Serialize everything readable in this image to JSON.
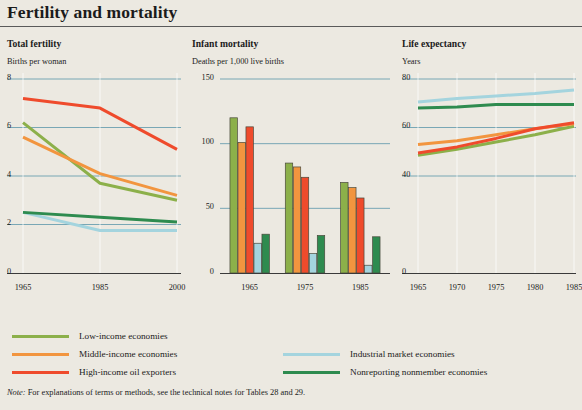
{
  "title": "Fertility and mortality",
  "note_prefix": "Note:",
  "note": " For explanations of terms or methods, see the technical notes for Tables 28 and 29.",
  "colors": {
    "background": "#ece9e1",
    "low_income": "#8cb04a",
    "middle_income": "#f2953f",
    "high_income_oil": "#ef4b2c",
    "industrial": "#a4d4de",
    "nonreporting": "#2e8b4f",
    "gridline": "#6c9fb0",
    "axis": "#3a3a3a",
    "title_rule": "#5a5a5a"
  },
  "legend": {
    "column1": [
      {
        "label": "Low-income economies",
        "color_key": "low_income"
      },
      {
        "label": "Middle-income economies",
        "color_key": "middle_income"
      },
      {
        "label": "High-income oil exporters",
        "color_key": "high_income_oil"
      }
    ],
    "column2": [
      {
        "label": "Industrial market economies",
        "color_key": "industrial"
      },
      {
        "label": "Nonreporting nonmember economies",
        "color_key": "nonreporting"
      }
    ]
  },
  "chart_data": [
    {
      "type": "line",
      "id": "total-fertility",
      "title": "Total fertility",
      "ylabel": "Births per woman",
      "xlabel": "",
      "x": [
        1965,
        1985,
        2000
      ],
      "tick_labels_x": [
        "1965",
        "1985",
        "2000"
      ],
      "ylim": [
        0,
        8
      ],
      "yticks": [
        0,
        2,
        4,
        6,
        8
      ],
      "ytick_labels": [
        "0",
        "2",
        "4",
        "6",
        "8"
      ],
      "grid": true,
      "series": [
        {
          "name": "Low-income economies",
          "color_key": "low_income",
          "values": [
            6.2,
            3.7,
            3.0
          ]
        },
        {
          "name": "Middle-income economies",
          "color_key": "middle_income",
          "values": [
            5.6,
            4.1,
            3.2
          ]
        },
        {
          "name": "High-income oil exporters",
          "color_key": "high_income_oil",
          "values": [
            7.2,
            6.8,
            5.1
          ]
        },
        {
          "name": "Industrial market economies",
          "color_key": "industrial",
          "values": [
            2.5,
            1.75,
            1.75
          ]
        },
        {
          "name": "Nonreporting nonmember economies",
          "color_key": "nonreporting",
          "values": [
            2.5,
            2.3,
            2.1
          ]
        }
      ]
    },
    {
      "type": "bar",
      "id": "infant-mortality",
      "title": "Infant mortality",
      "ylabel": "Deaths per 1,000 live births",
      "xlabel": "",
      "categories": [
        "1965",
        "1975",
        "1985"
      ],
      "ylim": [
        0,
        150
      ],
      "yticks": [
        0,
        50,
        100,
        150
      ],
      "ytick_labels": [
        "0",
        "50",
        "100",
        "150"
      ],
      "grid": true,
      "series": [
        {
          "name": "Low-income economies",
          "color_key": "low_income",
          "values": [
            120,
            85,
            70
          ]
        },
        {
          "name": "Middle-income economies",
          "color_key": "middle_income",
          "values": [
            101,
            82,
            66
          ]
        },
        {
          "name": "High-income oil exporters",
          "color_key": "high_income_oil",
          "values": [
            113,
            74,
            58
          ]
        },
        {
          "name": "Industrial market economies",
          "color_key": "industrial",
          "values": [
            23,
            15,
            6
          ]
        },
        {
          "name": "Nonreporting nonmember economies",
          "color_key": "nonreporting",
          "values": [
            30,
            29,
            28
          ]
        }
      ]
    },
    {
      "type": "line",
      "id": "life-expectancy",
      "title": "Life expectancy",
      "ylabel": "Years",
      "xlabel": "",
      "x": [
        1965,
        1970,
        1975,
        1980,
        1985
      ],
      "tick_labels_x": [
        "1965",
        "1970",
        "1975",
        "1980",
        "1985"
      ],
      "ylim": [
        0,
        80
      ],
      "yticks": [
        0,
        40,
        60,
        80
      ],
      "ytick_labels": [
        "0",
        "40",
        "60",
        "80"
      ],
      "grid": true,
      "series": [
        {
          "name": "Low-income economies",
          "color_key": "low_income",
          "values": [
            48.5,
            51.0,
            54.0,
            57.0,
            60.5
          ]
        },
        {
          "name": "Middle-income economies",
          "color_key": "middle_income",
          "values": [
            53.0,
            54.5,
            57.0,
            59.5,
            61.5
          ]
        },
        {
          "name": "High-income oil exporters",
          "color_key": "high_income_oil",
          "values": [
            49.5,
            52.0,
            55.5,
            59.5,
            62.0
          ]
        },
        {
          "name": "Industrial market economies",
          "color_key": "industrial",
          "values": [
            70.5,
            72.0,
            73.0,
            74.0,
            75.5
          ]
        },
        {
          "name": "Nonreporting nonmember economies",
          "color_key": "nonreporting",
          "values": [
            68.0,
            68.5,
            69.5,
            69.5,
            69.5
          ]
        }
      ]
    }
  ]
}
